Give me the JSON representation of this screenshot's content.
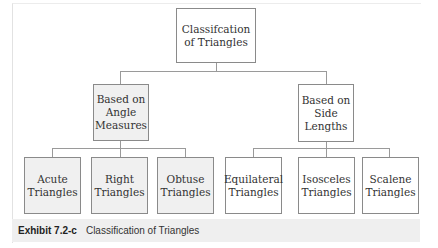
{
  "diagram": {
    "root": {
      "label": "Classifcation of Triangles"
    },
    "groups": [
      {
        "label": "Based on Angle Measures",
        "children": [
          "Acute Triangles",
          "Right Triangles",
          "Obtuse Triangles"
        ]
      },
      {
        "label": "Based on Side Lengths",
        "children": [
          "Equilateral Triangles",
          "Isosceles Triangles",
          "Scalene Triangles"
        ]
      }
    ]
  },
  "caption": {
    "exhibit": "Exhibit 7.2-c",
    "title": "Classification of Triangles"
  }
}
